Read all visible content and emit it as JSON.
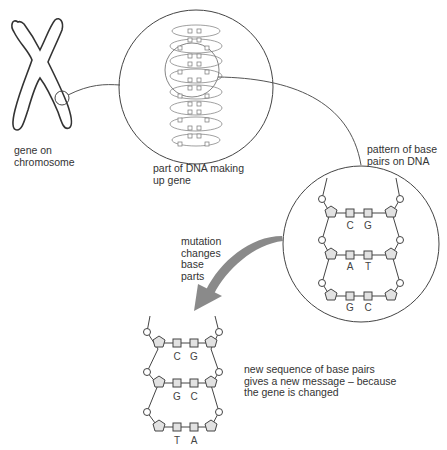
{
  "labels": {
    "gene_on_chromosome": "gene on\nchromosome",
    "part_of_dna": "part of DNA making\nup gene",
    "pattern_of_base_pairs": "pattern of base\npairs on DNA",
    "mutation": "mutation\nchanges\nbase\nparts",
    "new_sequence": "new sequence of base pairs\ngives a new message – because\nthe gene is changed"
  },
  "original_dna": {
    "pairs": [
      {
        "left": "C",
        "right": "G"
      },
      {
        "left": "A",
        "right": "T"
      },
      {
        "left": "G",
        "right": "C"
      }
    ]
  },
  "mutated_dna": {
    "pairs": [
      {
        "left": "C",
        "right": "G"
      },
      {
        "left": "G",
        "right": "C"
      },
      {
        "left": "T",
        "right": "A"
      }
    ]
  },
  "colors": {
    "line": "#444444",
    "shape_fill": "#e2e2e2",
    "arrow": "#8a8a8a",
    "text": "#333333"
  }
}
